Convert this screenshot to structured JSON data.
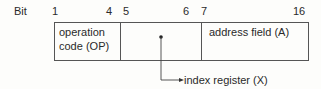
{
  "diagram": {
    "bit_label": "Bit",
    "bit_positions": [
      "1",
      "4",
      "5",
      "6",
      "7",
      "16"
    ],
    "fields": [
      {
        "name": "operation code (OP)",
        "line1": "operation",
        "line2": "code (OP)",
        "bits": "1-4"
      },
      {
        "name": "index register field",
        "bits": "5-6",
        "pointer_label": "index register (X)"
      },
      {
        "name": "address field (A)",
        "label": "address field (A)",
        "bits": "7-16"
      }
    ],
    "colors": {
      "line": "#555555",
      "text": "#2a2a2a",
      "background": "#fdfdfb"
    }
  }
}
